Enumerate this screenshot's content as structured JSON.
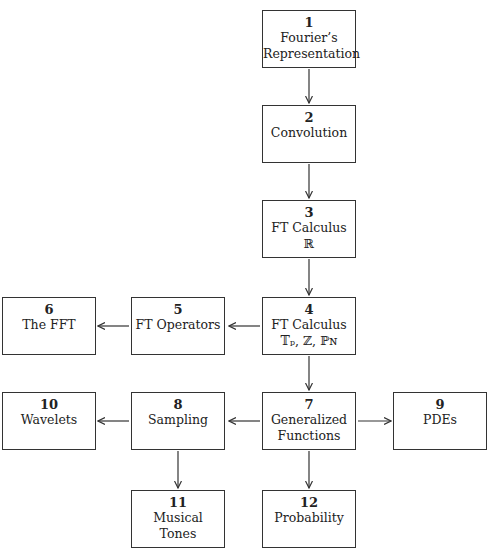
{
  "nodes": [
    {
      "id": "1",
      "number": "1",
      "line1": "Fourier’s",
      "line2": "Representation"
    },
    {
      "id": "2",
      "number": "2",
      "line1": "Convolution",
      "line2": ""
    },
    {
      "id": "3",
      "number": "3",
      "line1": "FT Calculus",
      "line2": "ℝ"
    },
    {
      "id": "4",
      "number": "4",
      "line1": "FT Calculus",
      "line2": "𝕋ₚ, ℤ, ℙɴ"
    },
    {
      "id": "5",
      "number": "5",
      "line1": "FT Operators",
      "line2": ""
    },
    {
      "id": "6",
      "number": "6",
      "line1": "The FFT",
      "line2": ""
    },
    {
      "id": "7",
      "number": "7",
      "line1": "Generalized",
      "line2": "Functions"
    },
    {
      "id": "8",
      "number": "8",
      "line1": "Sampling",
      "line2": ""
    },
    {
      "id": "9",
      "number": "9",
      "line1": "PDEs",
      "line2": ""
    },
    {
      "id": "10",
      "number": "10",
      "line1": "Wavelets",
      "line2": ""
    },
    {
      "id": "11",
      "number": "11",
      "line1": "Musical",
      "line2": "Tones"
    },
    {
      "id": "12",
      "number": "12",
      "line1": "Probability",
      "line2": ""
    }
  ],
  "edges": [
    {
      "from": "1",
      "to": "2"
    },
    {
      "from": "2",
      "to": "3"
    },
    {
      "from": "3",
      "to": "4"
    },
    {
      "from": "4",
      "to": "5"
    },
    {
      "from": "5",
      "to": "6"
    },
    {
      "from": "4",
      "to": "7"
    },
    {
      "from": "7",
      "to": "8"
    },
    {
      "from": "7",
      "to": "9"
    },
    {
      "from": "8",
      "to": "10"
    },
    {
      "from": "8",
      "to": "11"
    },
    {
      "from": "7",
      "to": "12"
    }
  ],
  "colors": {
    "line": "#333333",
    "background": "#ffffff"
  }
}
